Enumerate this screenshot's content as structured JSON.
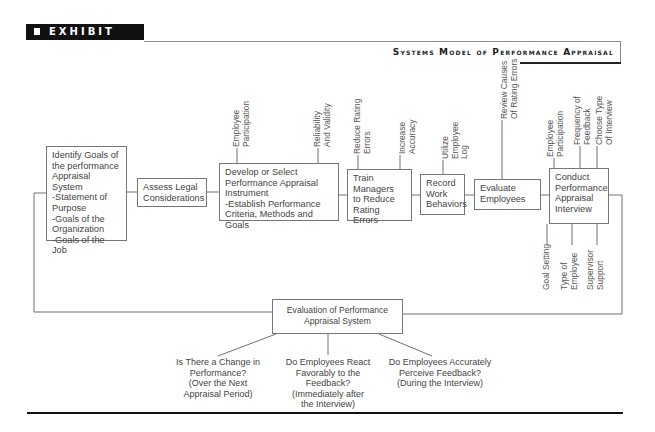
{
  "header": {
    "exhibit_label": "EXHIBIT 7.1",
    "title": "Systems Model of Performance Appraisal"
  },
  "flow_boxes": [
    {
      "id": "identify-goals",
      "lines": [
        "Identify Goals of",
        "the performance",
        "Appraisal System",
        "-Statement of",
        "Purpose",
        "-Goals of the",
        "Organization",
        "-Goals of the Job"
      ]
    },
    {
      "id": "assess-legal",
      "lines": [
        "Assess Legal",
        "Considerations"
      ]
    },
    {
      "id": "develop-instrument",
      "lines": [
        "Develop or Select",
        "Performance Appraisal",
        "Instrument",
        "-Establish Performance",
        "Criteria, Methods and Goals"
      ]
    },
    {
      "id": "train-managers",
      "lines": [
        "Train",
        "Managers",
        "to Reduce",
        "Rating Errors"
      ]
    },
    {
      "id": "record-behaviors",
      "lines": [
        "Record",
        "Work",
        "Behaviors"
      ]
    },
    {
      "id": "evaluate-employees",
      "lines": [
        "Evaluate",
        "Employees"
      ]
    },
    {
      "id": "conduct-interview",
      "lines": [
        "Conduct",
        "Performance",
        "Appraisal",
        "Interview"
      ]
    }
  ],
  "top_labels": [
    {
      "id": "employee-participation-1",
      "lines": [
        "Employee",
        "Participation"
      ]
    },
    {
      "id": "reliability-validity",
      "lines": [
        "Reliability",
        "And Validity"
      ]
    },
    {
      "id": "reduce-rating-errors",
      "lines": [
        "Reduce Rating",
        "Errors"
      ]
    },
    {
      "id": "increase-accuracy",
      "lines": [
        "Increase",
        "Accuracy"
      ]
    },
    {
      "id": "utilize-log",
      "lines": [
        "Utilize",
        "Employee",
        "Log"
      ]
    },
    {
      "id": "review-causes",
      "lines": [
        "Review Causes",
        "Of Rating Errors"
      ]
    },
    {
      "id": "employee-participation-2",
      "lines": [
        "Employee",
        "Participation"
      ]
    },
    {
      "id": "frequency-feedback",
      "lines": [
        "Frequency of",
        "Feedback"
      ]
    },
    {
      "id": "choose-interview",
      "lines": [
        "Choose Type",
        "Of Interview"
      ]
    }
  ],
  "bottom_labels": [
    {
      "id": "goal-setting",
      "lines": [
        "Goal Setting"
      ]
    },
    {
      "id": "type-of-employee",
      "lines": [
        "Type of",
        "Employee"
      ]
    },
    {
      "id": "supervisor-support",
      "lines": [
        "Supervisor",
        "Support"
      ]
    }
  ],
  "evaluation_box": {
    "lines": [
      "Evaluation of Performance",
      "Appraisal System"
    ]
  },
  "questions": [
    {
      "id": "change-in-performance",
      "lines": [
        "Is There a Change in",
        "Performance?",
        "(Over the Next",
        "Appraisal Period)"
      ]
    },
    {
      "id": "react-favorably",
      "lines": [
        "Do Employees React",
        "Favorably to the",
        "Feedback?",
        "(Immediately after",
        "the Interview)"
      ]
    },
    {
      "id": "perceive-feedback",
      "lines": [
        "Do Employees Accurately",
        "Perceive Feedback?",
        "(During the Interview)"
      ]
    }
  ]
}
